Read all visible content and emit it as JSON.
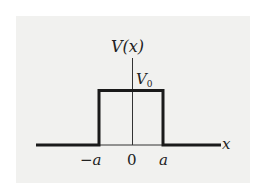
{
  "diagram": {
    "y_axis_label": "V(x)",
    "x_axis_label": "x",
    "barrier_height_label": "V",
    "barrier_height_subscript": "0",
    "tick_labels": [
      "−a",
      "0",
      "a"
    ],
    "colors": {
      "background": "#f1f1ef",
      "line": "#1a1a1a",
      "axis": "#333333"
    }
  }
}
